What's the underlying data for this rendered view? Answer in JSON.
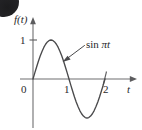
{
  "figure": {
    "type": "line-plot",
    "axes": {
      "y_axis_label": "f(t)",
      "x_axis_label": "t",
      "origin_label": "0",
      "y_ticks": [
        {
          "label": "1",
          "value": 1
        }
      ],
      "x_ticks": [
        {
          "label": "1",
          "value": 1
        },
        {
          "label": "2",
          "value": 2
        }
      ]
    },
    "annotation": {
      "label_roman": "sin",
      "label_italic": "πt",
      "full_label": "sin πt"
    },
    "artifact": {
      "name": "scan-smudge",
      "color": "#1c1c1e"
    },
    "colors": {
      "curve": "#4a4a4c",
      "axis": "#6e6e70",
      "text": "#29292b",
      "background": "#ffffff"
    }
  },
  "chart_data": {
    "type": "line",
    "title": "",
    "subtitle": "",
    "xlabel": "t",
    "ylabel": "f(t)",
    "xlim": [
      -0.25,
      2.55
    ],
    "ylim": [
      -1.25,
      1.35
    ],
    "grid": false,
    "legend": "none",
    "xticks": [
      0,
      1,
      2
    ],
    "xticklabels": [
      "0",
      "1",
      "2"
    ],
    "yticks": [
      1
    ],
    "yticklabels": [
      "1"
    ],
    "annotations": [
      {
        "text": "sin πt",
        "points_to_x": 1.1,
        "points_to_y": 0.55
      }
    ],
    "series": [
      {
        "name": "sin πt",
        "expression": "sin(πt)",
        "x": [
          0,
          0.05,
          0.1,
          0.15,
          0.2,
          0.25,
          0.3,
          0.35,
          0.4,
          0.45,
          0.5,
          0.55,
          0.6,
          0.65,
          0.7,
          0.75,
          0.8,
          0.85,
          0.9,
          0.95,
          1,
          1.05,
          1.1,
          1.15,
          1.2,
          1.25,
          1.3,
          1.35,
          1.4,
          1.45,
          1.5,
          1.55,
          1.6,
          1.65,
          1.7,
          1.75,
          1.8,
          1.85,
          1.9,
          1.95,
          2
        ],
        "y": [
          0,
          0.156,
          0.309,
          0.454,
          0.588,
          0.707,
          0.809,
          0.891,
          0.951,
          0.988,
          1,
          0.988,
          0.951,
          0.891,
          0.809,
          0.707,
          0.588,
          0.454,
          0.309,
          0.156,
          0,
          -0.156,
          -0.309,
          -0.454,
          -0.588,
          -0.707,
          -0.809,
          -0.891,
          -0.951,
          -0.988,
          -1,
          -0.988,
          -0.951,
          -0.891,
          -0.809,
          -0.707,
          -0.588,
          -0.454,
          -0.309,
          -0.156,
          0
        ]
      }
    ]
  }
}
